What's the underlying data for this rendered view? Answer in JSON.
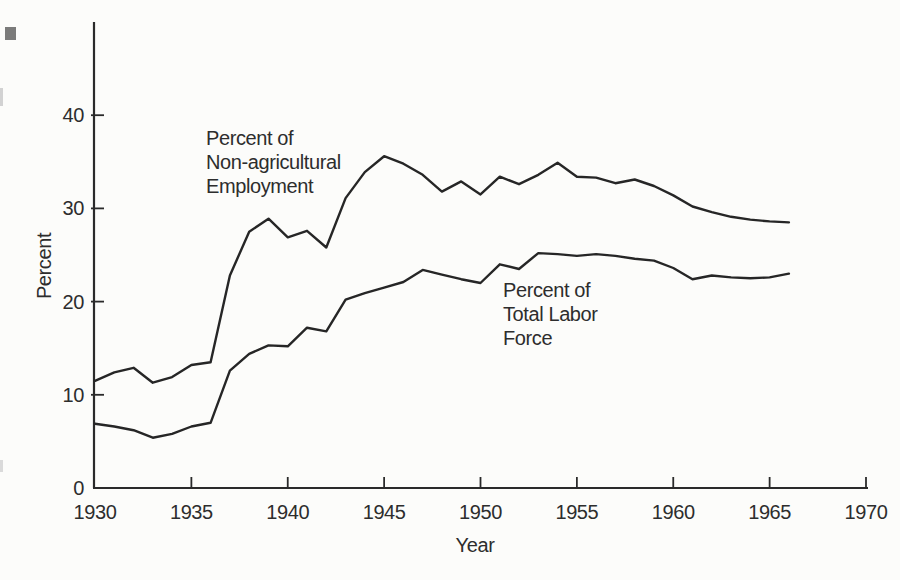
{
  "page": {
    "background": "#fcfcfa",
    "ink_color": "#2a2a2a",
    "text_color": "#2d2d2d"
  },
  "chart_data": {
    "type": "line",
    "title": "",
    "xlabel": "Year",
    "ylabel": "Percent",
    "xlim": [
      1930,
      1970
    ],
    "ylim": [
      0,
      50
    ],
    "grid": false,
    "x_ticks": [
      1930,
      1935,
      1940,
      1945,
      1950,
      1955,
      1960,
      1965,
      1970
    ],
    "y_ticks": [
      0,
      10,
      20,
      30,
      40
    ],
    "x": [
      1930,
      1931,
      1932,
      1933,
      1934,
      1935,
      1936,
      1937,
      1938,
      1939,
      1940,
      1941,
      1942,
      1943,
      1944,
      1945,
      1946,
      1947,
      1948,
      1949,
      1950,
      1951,
      1952,
      1953,
      1954,
      1955,
      1956,
      1957,
      1958,
      1959,
      1960,
      1961,
      1962,
      1963,
      1964,
      1965,
      1966
    ],
    "series": [
      {
        "name": "Percent of Non-agricultural Employment",
        "values": [
          11.5,
          12.4,
          12.9,
          11.3,
          11.9,
          13.2,
          13.5,
          22.8,
          27.5,
          28.9,
          26.9,
          27.6,
          25.8,
          31.1,
          33.9,
          35.6,
          34.8,
          33.6,
          31.8,
          32.9,
          31.5,
          33.4,
          32.6,
          33.6,
          34.9,
          33.4,
          33.3,
          32.7,
          33.1,
          32.4,
          31.4,
          30.2,
          29.6,
          29.1,
          28.8,
          28.6,
          28.5
        ]
      },
      {
        "name": "Percent of Total Labor Force",
        "values": [
          6.9,
          6.6,
          6.2,
          5.4,
          5.8,
          6.6,
          7.0,
          12.6,
          14.4,
          15.3,
          15.2,
          17.2,
          16.8,
          20.2,
          20.9,
          21.5,
          22.1,
          23.4,
          22.9,
          22.4,
          22.0,
          24.0,
          23.5,
          25.2,
          25.1,
          24.9,
          25.1,
          24.9,
          24.6,
          24.4,
          23.6,
          22.4,
          22.8,
          22.6,
          22.5,
          22.6,
          23.0
        ]
      }
    ],
    "annotations": [
      {
        "lines": [
          "Percent of",
          "Non-agricultural",
          "Employment"
        ]
      },
      {
        "lines": [
          "Percent of",
          "Total Labor",
          "Force"
        ]
      }
    ]
  }
}
